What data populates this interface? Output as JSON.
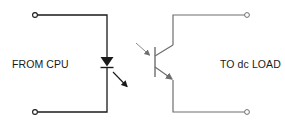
{
  "diagram": {
    "left_label": "FROM CPU",
    "right_label": "TO dc LOAD",
    "components": [
      {
        "id": "led",
        "type": "light-emitting-diode",
        "side": "input"
      },
      {
        "id": "phototransistor",
        "type": "npn-phototransistor",
        "side": "output"
      }
    ],
    "terminals": [
      {
        "id": "input-top",
        "side": "left"
      },
      {
        "id": "input-bottom",
        "side": "left"
      },
      {
        "id": "output-top",
        "side": "right"
      },
      {
        "id": "output-bottom",
        "side": "right"
      }
    ],
    "colors": {
      "input_wire": "#1a1a1a",
      "output_wire": "#6e6e6e",
      "background": "#ffffff"
    }
  }
}
